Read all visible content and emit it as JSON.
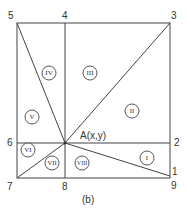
{
  "diagram": {
    "caption": "(b)",
    "point_label": "A(x,y)",
    "corner_labels": [
      {
        "id": "1",
        "text": "1",
        "x": 172,
        "y": 175
      },
      {
        "id": "2",
        "text": "2",
        "x": 174,
        "y": 146
      },
      {
        "id": "3",
        "text": "3",
        "x": 171,
        "y": 19
      },
      {
        "id": "4",
        "text": "4",
        "x": 62,
        "y": 19
      },
      {
        "id": "5",
        "text": "5",
        "x": 8,
        "y": 19
      },
      {
        "id": "6",
        "text": "6",
        "x": 7,
        "y": 146
      },
      {
        "id": "7",
        "text": "7",
        "x": 7,
        "y": 190
      },
      {
        "id": "8",
        "text": "8",
        "x": 62,
        "y": 190
      },
      {
        "id": "9",
        "text": "9",
        "x": 171,
        "y": 189
      }
    ],
    "regions": [
      {
        "id": "I",
        "text": "I",
        "x": 147,
        "y": 158
      },
      {
        "id": "II",
        "text": "II",
        "x": 132,
        "y": 111
      },
      {
        "id": "III",
        "text": "III",
        "x": 90,
        "y": 73
      },
      {
        "id": "IV",
        "text": "IV",
        "x": 49,
        "y": 73
      },
      {
        "id": "V",
        "text": "V",
        "x": 32,
        "y": 117
      },
      {
        "id": "VI",
        "text": "VI",
        "x": 28,
        "y": 150
      },
      {
        "id": "VII",
        "text": "VII",
        "x": 52,
        "y": 163
      },
      {
        "id": "VIII",
        "text": "VIII",
        "x": 82,
        "y": 163
      }
    ]
  }
}
